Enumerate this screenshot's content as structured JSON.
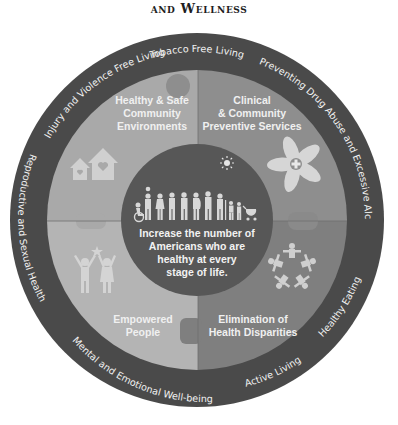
{
  "title": "and Wellness",
  "colors": {
    "outer_ring": "#4a4a4a",
    "quadrant_top_left": "#a9a9a9",
    "quadrant_top_right": "#8e8e8e",
    "quadrant_bottom_left": "#b4b4b4",
    "quadrant_bottom_right": "#7f7f7f",
    "center_circle": "#575757",
    "text_light": "#f2f2f2",
    "icon_light": "#d6d6d6"
  },
  "outer_ring": {
    "items": [
      {
        "label": "Tobacco Free Living"
      },
      {
        "label": "Preventing Drug Abuse and Excessive Alcohol Use"
      },
      {
        "label": "Healthy Eating"
      },
      {
        "label": "Active Living"
      },
      {
        "label": "Mental and Emotional Well-being"
      },
      {
        "label": "Reproductive and Sexual Health"
      },
      {
        "label": "Injury and Violence Free Living"
      }
    ]
  },
  "quadrants": [
    {
      "position": "top-left",
      "lines": [
        "Healthy & Safe",
        "Community",
        "Environments"
      ],
      "icon": "houses-with-hearts-icon"
    },
    {
      "position": "top-right",
      "lines": [
        "Clinical",
        "& Community",
        "Preventive Services"
      ],
      "icon": "joined-hands-medical-cross-icon"
    },
    {
      "position": "bottom-left",
      "lines": [
        "Empowered",
        "People"
      ],
      "icon": "people-raising-arms-star-icon"
    },
    {
      "position": "bottom-right",
      "lines": [
        "Elimination of",
        "Health Disparities"
      ],
      "icon": "circle-of-people-icon"
    }
  ],
  "center": {
    "lines": [
      "Increase the number of",
      "Americans who are",
      "healthy at every",
      "stage of life."
    ],
    "icons": [
      "sun-icon",
      "diverse-people-lifespan-icon"
    ]
  }
}
